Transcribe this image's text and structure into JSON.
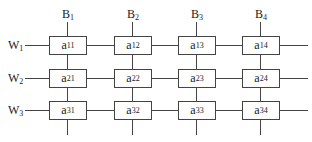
{
  "diagram": {
    "bit_lines": [
      {
        "base": "B",
        "index": "1"
      },
      {
        "base": "B",
        "index": "2"
      },
      {
        "base": "B",
        "index": "3"
      },
      {
        "base": "B",
        "index": "4"
      }
    ],
    "word_lines": [
      {
        "base": "W",
        "index": "1"
      },
      {
        "base": "W",
        "index": "2"
      },
      {
        "base": "W",
        "index": "3"
      }
    ],
    "cells": [
      [
        {
          "base": "a",
          "index": "11"
        },
        {
          "base": "a",
          "index": "12"
        },
        {
          "base": "a",
          "index": "13"
        },
        {
          "base": "a",
          "index": "14"
        }
      ],
      [
        {
          "base": "a",
          "index": "21"
        },
        {
          "base": "a",
          "index": "22"
        },
        {
          "base": "a",
          "index": "23"
        },
        {
          "base": "a",
          "index": "24"
        }
      ],
      [
        {
          "base": "a",
          "index": "31"
        },
        {
          "base": "a",
          "index": "32"
        },
        {
          "base": "a",
          "index": "33"
        },
        {
          "base": "a",
          "index": "34"
        }
      ]
    ],
    "line_color": "#444444"
  }
}
